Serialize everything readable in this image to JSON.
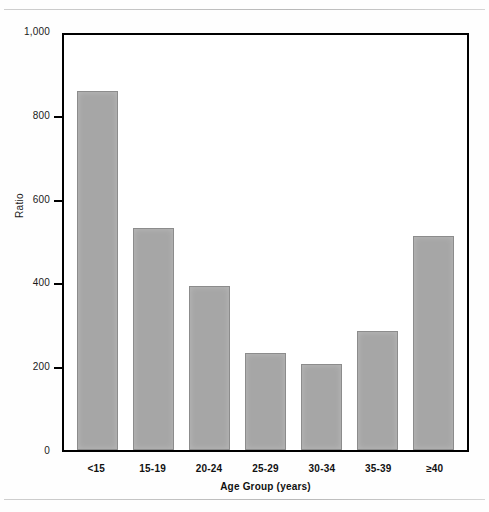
{
  "chart_data": {
    "type": "bar",
    "title": "",
    "xlabel": "Age Group (years)",
    "ylabel": "Ratio",
    "categories": [
      "<15",
      "15-19",
      "20-24",
      "25-29",
      "30-34",
      "35-39",
      "≥40"
    ],
    "values": [
      857,
      530,
      391,
      232,
      205,
      284,
      511
    ],
    "ylim": [
      0,
      1000
    ],
    "ytick_labels": [
      "0",
      "200",
      "400",
      "600",
      "800",
      "1,000"
    ],
    "ytick_values": [
      0,
      200,
      400,
      600,
      800,
      1000
    ],
    "grid": false,
    "legend": null,
    "bar_color": "#a6a6a6",
    "bar_edge_color": "#8c8c8c",
    "axis_color": "#000000"
  },
  "figure": {
    "background": "#ffffff",
    "rule_color": "#c4c4c4"
  }
}
